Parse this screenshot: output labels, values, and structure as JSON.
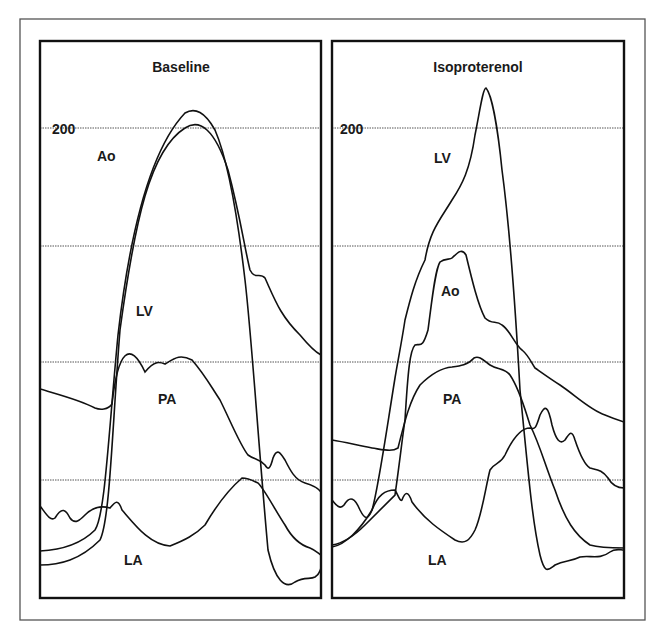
{
  "figure": {
    "outer_frame": {
      "x": 20,
      "y": 19,
      "w": 625,
      "h": 601,
      "color": "#555555"
    },
    "grid": {
      "style": "dotted",
      "color": "#555555"
    }
  },
  "chart_data": [
    {
      "type": "line",
      "title": "Baseline",
      "xlabel": "",
      "ylabel": "Pressure",
      "ytick_labels": [
        "200"
      ],
      "grid": true,
      "gridlines_y_px": [
        128,
        246,
        362,
        480
      ],
      "panel": {
        "x": 40,
        "y": 41,
        "w": 281,
        "h": 557
      },
      "title_pos": {
        "x": 181,
        "y": 72
      },
      "ytick_pos": {
        "x": 52,
        "y": 134
      },
      "series": [
        {
          "name": "Ao",
          "label_pos": {
            "x": 97,
            "y": 161
          },
          "path": "M40,565 C60,565 80,560 100,540 C110,520 112,430 120,330 C135,220 150,150 185,128 C200,118 215,130 228,170 C240,215 245,250 250,270 C255,280 260,272 265,278 C275,300 280,315 300,335 C310,347 315,352 321,355"
        },
        {
          "name": "LV",
          "label_pos": {
            "x": 136,
            "y": 316
          },
          "path": "M40,551 C60,550 80,545 95,530 C105,515 108,440 118,335 C130,230 150,150 185,113 C195,107 205,112 215,130 C228,160 238,220 245,280 C252,340 258,440 268,550 C275,580 285,590 295,582 C305,576 310,580 315,577 C318,575 320,572 321,568"
        },
        {
          "name": "PA",
          "label_pos": {
            "x": 158,
            "y": 404
          },
          "path": "M40,389 C60,395 80,400 95,408 C100,410 108,410 112,404 C118,350 130,340 145,372 C155,360 160,362 165,364 C175,358 180,354 192,360 C205,375 210,385 220,400 C230,420 240,445 248,455 C255,460 258,458 265,465 C268,470 270,470 273,458 C277,448 280,452 285,460 C290,470 295,480 305,483 C312,485 318,488 321,492"
        },
        {
          "name": "LA",
          "label_pos": {
            "x": 124,
            "y": 565
          },
          "path": "M40,506 C45,512 50,522 55,518 C62,506 66,510 70,518 C75,525 80,520 85,515 C92,508 100,505 110,508 C115,502 118,498 122,510 C135,525 150,545 170,546 C185,540 195,535 205,525 C215,508 228,490 242,478 C250,478 255,482 258,483 C265,490 275,510 285,525 C292,538 300,545 310,548 C315,550 318,553 321,555"
        }
      ]
    },
    {
      "type": "line",
      "title": "Isoproterenol",
      "xlabel": "",
      "ylabel": "Pressure",
      "ytick_labels": [
        "200"
      ],
      "grid": true,
      "gridlines_y_px": [
        128,
        246,
        362,
        480
      ],
      "panel": {
        "x": 332,
        "y": 41,
        "w": 292,
        "h": 557
      },
      "title_pos": {
        "x": 478,
        "y": 72
      },
      "ytick_pos": {
        "x": 340,
        "y": 134
      },
      "series": [
        {
          "name": "LV",
          "label_pos": {
            "x": 434,
            "y": 163
          },
          "path": "M332,547 C345,545 360,530 372,510 C378,490 385,440 395,378 C398,360 402,340 405,320 C410,300 415,280 425,260 C430,230 440,220 452,200 C462,185 470,170 475,135 C480,110 483,88 486,88 C492,95 498,130 502,170 C510,230 515,300 520,390 C528,470 532,520 540,555 C545,575 548,570 555,565 C565,560 570,562 580,557 C590,555 600,560 610,552 C615,548 620,550 624,550"
        },
        {
          "name": "Ao",
          "label_pos": {
            "x": 441,
            "y": 296
          },
          "path": "M332,545 C345,543 355,535 365,525 C375,515 385,505 395,495 C400,460 402,440 405,420 C408,370 410,350 415,345 C420,343 422,350 428,330 C432,300 435,270 440,262 C445,258 450,260 452,258 C458,252 462,248 466,255 C472,280 478,305 485,318 C492,325 496,320 502,325 C510,330 515,345 522,350 C528,355 530,360 535,368 C545,375 552,380 560,385 C575,395 590,410 605,415 C612,418 618,420 624,422"
        },
        {
          "name": "PA",
          "label_pos": {
            "x": 443,
            "y": 404
          },
          "path": "M332,440 C345,442 360,446 372,448 C385,450 392,452 398,448 C405,420 410,400 420,385 C430,375 440,368 452,367 C460,366 468,365 474,358 C480,355 485,362 490,365 C498,370 505,368 510,375 C520,390 525,410 530,425 C540,445 545,465 555,490 C565,520 575,535 590,545 C600,548 615,548 624,548"
        },
        {
          "name": "LA",
          "label_pos": {
            "x": 428,
            "y": 565
          },
          "path": "M332,500 C336,505 340,510 344,505 C350,495 355,498 360,510 C365,520 368,520 372,510 C378,495 385,490 395,490 C398,495 400,502 402,500 C405,492 408,490 412,502 C425,520 440,530 455,540 C465,545 470,540 475,530 C482,515 486,485 490,470 C495,462 500,465 505,455 C512,440 520,428 530,428 C535,430 536,428 540,415 C545,405 548,405 552,425 C556,440 560,445 565,440 C570,432 572,430 575,440 C580,455 585,465 590,468 C598,470 602,470 608,478 C612,485 618,488 624,488"
        }
      ]
    }
  ]
}
